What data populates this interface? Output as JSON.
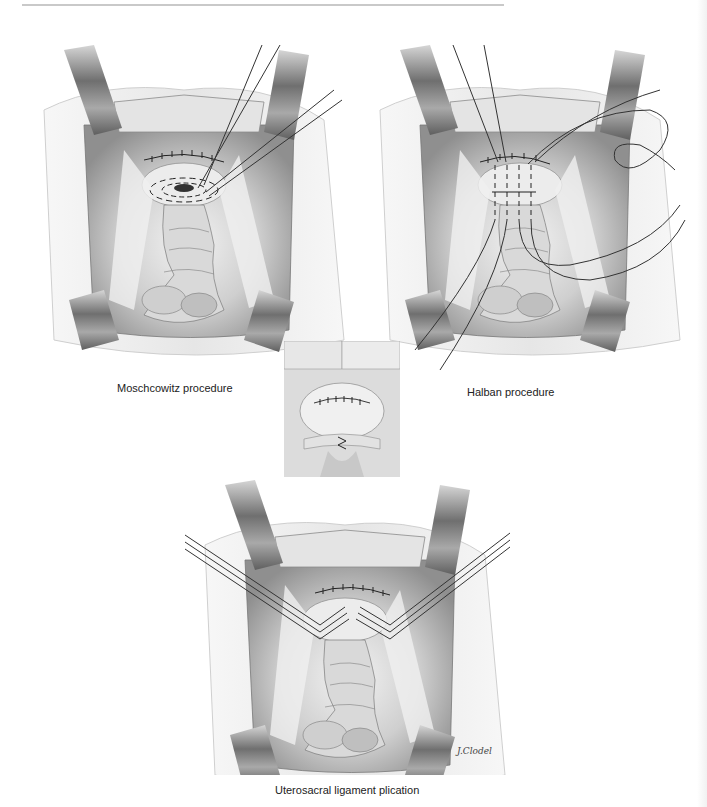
{
  "page": {
    "type": "textbook-figure-page",
    "figures": [
      {
        "id": "top-left",
        "caption": "Moschcowitz procedure"
      },
      {
        "id": "top-right",
        "caption": "Halban procedure"
      },
      {
        "id": "inset",
        "caption": ""
      },
      {
        "id": "bottom",
        "caption": "Uterosacral ligament plication"
      }
    ],
    "signature": "J.Clodel",
    "colors": {
      "ink": "#222222",
      "tissue_light": "#e9e9e9",
      "tissue_mid": "#b5b5b5",
      "tissue_dark": "#6e6e6e",
      "retractor": "#8a8a8a",
      "rule": "#c9c9c9"
    }
  }
}
